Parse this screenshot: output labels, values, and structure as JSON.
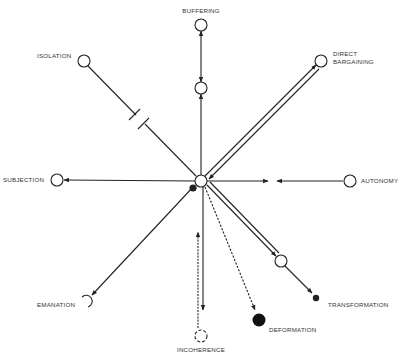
{
  "diagram": {
    "title_partial": "",
    "center": {
      "x": 201,
      "y": 181,
      "r": 6
    },
    "nodes": {
      "buffering": {
        "label": "BUFFERING",
        "x": 201,
        "y": 25
      },
      "buffering_mid": {
        "label": "",
        "x": 201,
        "y": 88
      },
      "isolation": {
        "label": "ISOLATION",
        "x": 84,
        "y": 61
      },
      "direct_bargaining": {
        "label_line1": "DIRECT",
        "label_line2": "BARGAINING",
        "x": 321,
        "y": 61
      },
      "subjection": {
        "label": "SUBJECTION",
        "x": 57,
        "y": 180
      },
      "autonomy": {
        "label": "AUTONOMY",
        "x": 350,
        "y": 181
      },
      "emanation": {
        "label": "EMANATION",
        "x": 88,
        "y": 301
      },
      "incoherence": {
        "label": "INCOHERENCE",
        "x": 201,
        "y": 336
      },
      "deformation": {
        "label": "DEFORMATION",
        "x": 259,
        "y": 320
      },
      "transformation_mid": {
        "label": "",
        "x": 281,
        "y": 261
      },
      "transformation": {
        "label": "TRANSFORMATION",
        "x": 317,
        "y": 298
      }
    },
    "colors": {
      "ink": "#222222",
      "text": "#333333",
      "background": "#ffffff"
    }
  }
}
